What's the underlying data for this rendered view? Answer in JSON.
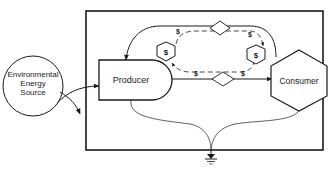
{
  "diagram": {
    "type": "energy-flow / economic systems diagram",
    "nodes": {
      "source": {
        "label_lines": [
          "Environmental",
          "Energy",
          "Source"
        ],
        "shape": "circle"
      },
      "producer": {
        "label": "Producer",
        "shape": "bullet (rect with rounded right end)"
      },
      "consumer": {
        "label": "Consumer",
        "shape": "hexagon"
      },
      "money_left": {
        "label": "$",
        "shape": "small hexagon"
      },
      "money_right": {
        "label": "$",
        "shape": "small hexagon"
      },
      "heat_sink": {
        "shape": "ground symbol"
      }
    },
    "flow_labels": {
      "top_left": "$",
      "top_right": "$",
      "bottom_left": "$",
      "bottom_right": "$"
    },
    "interactions": [
      "top-diamond",
      "bottom-diamond"
    ],
    "colors": {
      "stroke": "#1a1a1a",
      "background": "#ffffff"
    }
  }
}
